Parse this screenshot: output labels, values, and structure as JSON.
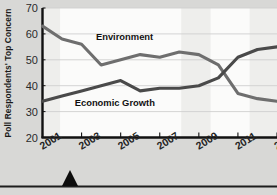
{
  "chart_data": {
    "type": "line",
    "title": "",
    "subtitle": "",
    "xlabel": "",
    "ylabel": "Poll Respondents' Top Concern",
    "x": [
      2001,
      2002,
      2003,
      2004,
      2005,
      2006,
      2007,
      2008,
      2009,
      2010,
      2011,
      2012,
      2013
    ],
    "xlim": [
      2001,
      2013
    ],
    "ylim": [
      20,
      70
    ],
    "yticks": [
      20,
      30,
      40,
      50,
      60,
      70
    ],
    "xticks": [
      2001,
      2003,
      2005,
      2007,
      2009,
      2011,
      2013
    ],
    "xtick_labels": [
      "2001",
      "2003",
      "2005",
      "2007",
      "2009",
      "2011",
      "2013"
    ],
    "ytick_labels": [
      "20",
      "30",
      "40",
      "50",
      "60",
      "70"
    ],
    "grid": true,
    "grid_axis": "y",
    "legend": "inline-annotations",
    "series": [
      {
        "name": "Environment",
        "color": "#6e6e6e",
        "values": [
          63,
          58,
          56,
          48,
          50,
          52,
          51,
          53,
          52,
          48,
          37,
          35,
          34
        ]
      },
      {
        "name": "Economic Growth",
        "color": "#4a4a4a",
        "values": [
          34,
          36,
          38,
          40,
          42,
          38,
          39,
          39,
          40,
          43,
          51,
          54,
          55
        ]
      }
    ],
    "annotations": [
      {
        "text": "Environment",
        "x": 2005.2,
        "y": 57.5
      },
      {
        "text": "Economic Growth",
        "x": 2004.7,
        "y": 32.2
      }
    ],
    "shaded_bands": [
      {
        "from": 2001.0,
        "to": 2001.9
      },
      {
        "from": 2008.1,
        "to": 2009.6
      },
      {
        "from": 2011.6,
        "to": 2013.0
      }
    ]
  },
  "colors": {
    "page_background": "#d8d8d6",
    "plot_background": "#fbfbfa",
    "band": "#eeeeec",
    "axis": "#111111",
    "grid": "#cfcfcf",
    "environment_line": "#6e6e6e",
    "economic_line": "#4a4a4a",
    "text": "#1a1a1a"
  },
  "decorations": {
    "bottom_rule": "horizontal-rule",
    "triangle_marker": "black-triangle-pointer"
  }
}
